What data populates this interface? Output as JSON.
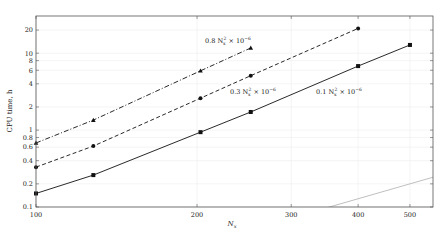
{
  "chart_data": {
    "type": "line",
    "title": "",
    "xlabel": "N_x",
    "ylabel": "CPU time, h",
    "xscale": "log",
    "yscale": "log",
    "xlim": [
      100,
      550
    ],
    "ylim": [
      0.1,
      30
    ],
    "xticks": [
      100,
      200,
      300,
      400,
      500
    ],
    "xtick_labels": [
      "100",
      "200",
      "300",
      "400",
      "500"
    ],
    "yticks": [
      0.1,
      0.2,
      0.4,
      0.6,
      0.8,
      1,
      2,
      4,
      6,
      8,
      10,
      20
    ],
    "ytick_labels": [
      "0.1",
      "0.2",
      "0.4",
      "0.6",
      "0.8",
      "1",
      "2",
      "4",
      "6",
      "8",
      "10",
      "20"
    ],
    "grid": true,
    "legend": null,
    "series": [
      {
        "name": "dash-dot triangles",
        "style": "dash-dot",
        "marker": "triangle",
        "x": [
          100,
          128,
          203,
          252
        ],
        "values": [
          0.68,
          1.35,
          5.9,
          11.7
        ]
      },
      {
        "name": "dashed circles",
        "style": "dashed",
        "marker": "circle",
        "x": [
          100,
          128,
          203,
          252,
          400
        ],
        "values": [
          0.33,
          0.62,
          2.6,
          5.1,
          21
        ]
      },
      {
        "name": "solid squares",
        "style": "solid",
        "marker": "square",
        "x": [
          100,
          128,
          203,
          252,
          400,
          500
        ],
        "values": [
          0.15,
          0.26,
          0.94,
          1.72,
          6.8,
          12.8
        ]
      }
    ],
    "reference_lines": [
      {
        "label": "0.8 N_x^2 × 10^-6",
        "coef": 8e-07,
        "exponent": 2,
        "color": "#b0b0b0"
      },
      {
        "label": "0.3 N_x^2 × 10^-6",
        "coef": 3e-07,
        "exponent": 2,
        "color": "#b0b0b0"
      },
      {
        "label": "0.1 N_x^2 × 10^-6",
        "coef": 1e-07,
        "exponent": 2,
        "color": "#b0b0b0"
      }
    ],
    "annotations": [
      {
        "text_main": "0.8 N",
        "sub": "x",
        "sup": "2",
        "tail": " × 10",
        "exp": "−6",
        "x": 205,
        "y": 43
      },
      {
        "text_main": "0.3 N",
        "sub": "x",
        "sup": "2",
        "tail": " × 10",
        "exp": "−6",
        "x": 230,
        "y": 94
      },
      {
        "text_main": "0.1 N",
        "sub": "x",
        "sup": "2",
        "tail": " × 10",
        "exp": "−6",
        "x": 316,
        "y": 94
      }
    ]
  },
  "axes": {
    "x_label_main": "N",
    "x_label_sub": "x",
    "y_label": "CPU time, h"
  },
  "colors": {
    "data_line": "#111111",
    "reference": "#b8b8b8",
    "grid": "#ececec",
    "frame": "#555555"
  }
}
